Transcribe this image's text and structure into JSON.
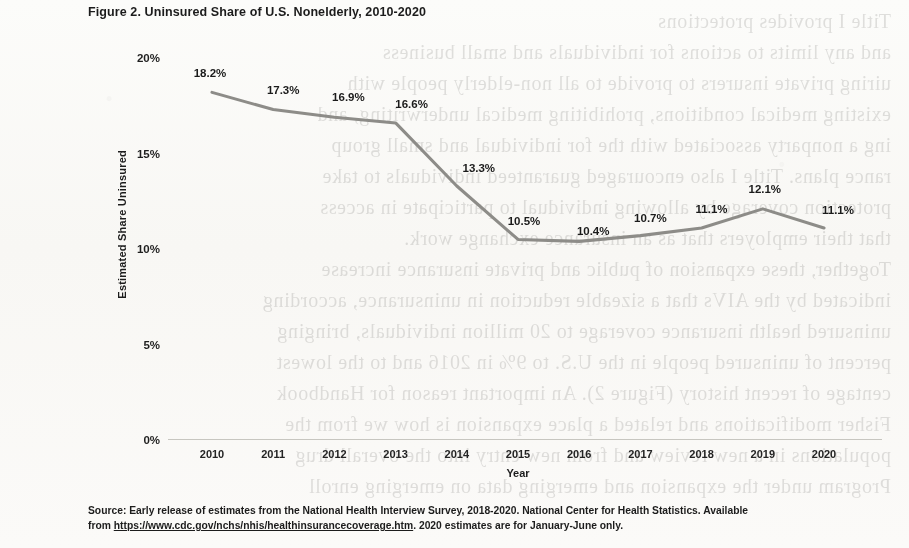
{
  "figure": {
    "title": "Figure 2. Uninsured Share of U.S. Nonelderly, 2010-2020"
  },
  "source": {
    "line1_prefix": "Source: Early release of estimates from the National Health Interview Survey, 2018-2020. National Center for Health Statistics. Available",
    "line2_prefix": "from ",
    "url": "https://www.cdc.gov/nchs/nhis/healthinsurancecoverage.htm",
    "line2_suffix": ". 2020 estimates are for January-June only."
  },
  "chart_data": {
    "type": "line",
    "title": "Figure 2. Uninsured Share of U.S. Nonelderly, 2010-2020",
    "xlabel": "Year",
    "ylabel": "Estimated Share Uninsured",
    "categories": [
      "2010",
      "2011",
      "2012",
      "2013",
      "2014",
      "2015",
      "2016",
      "2017",
      "2018",
      "2019",
      "2020"
    ],
    "values": [
      18.2,
      17.3,
      16.9,
      16.6,
      13.3,
      10.5,
      10.4,
      10.7,
      11.1,
      12.1,
      11.1
    ],
    "point_labels": [
      "18.2%",
      "17.3%",
      "16.9%",
      "16.6%",
      "13.3%",
      "10.5%",
      "10.4%",
      "10.7%",
      "11.1%",
      "12.1%",
      "11.1%"
    ],
    "ylim": [
      0,
      20
    ],
    "yticks": [
      0,
      5,
      10,
      15,
      20
    ],
    "ytick_labels": [
      "0%",
      "5%",
      "10%",
      "15%",
      "20%"
    ],
    "grid": false,
    "legend": false,
    "series_color": "#8d8c88"
  },
  "ghost_text": {
    "lines": [
      "Title I provides protections",
      "and any limits to actions for individuals and small business",
      "uiring private insurers to provide to all non-elderly people with",
      "existing medical conditions, prohibiting medical underwriting, and",
      "ing a nonparty associated with the for individual and small group",
      "rance plans. Title I also encouraged guaranteed individuals to take",
      "protection coverage by allowing individual to participate in access",
      "that their employers that as an insurance exchange work.",
      "Together, these expansion of public and private insurance increase",
      "indicated by the AIVs that a sizeable reduction in uninsurance, according",
      "uninsured health insurance coverage to 20 million individuals, bringing",
      "percent of uninsured people in the U.S. to 9% in 2016 and to the lowest",
      "centage of recent history (Figure 2). An important reason for Handbook",
      "Fisher modifications and related a place expansion is how we from the",
      "populations in a new review and from new entry into the overall drug",
      "Program under the expansion and emerging data on emerging enroll"
    ]
  }
}
